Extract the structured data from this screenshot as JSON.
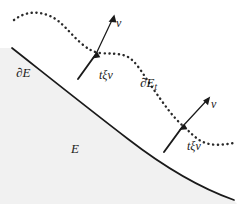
{
  "figure": {
    "background_color": "#ffffff",
    "region_fill_color": "#f1f1f1",
    "curve_color": "#1a1a1a",
    "labels": {
      "set_interior": "E",
      "boundary_original": "∂E",
      "boundary_deformed_prefix": "∂E",
      "boundary_deformed_subscript": "t",
      "normal_1": "ν",
      "normal_2": "ν",
      "displacement_1": "tξν",
      "displacement_2": "tξν"
    },
    "elements": {
      "solid_curve_name": "original boundary curve",
      "dotted_curve_name": "deformed boundary curve",
      "arrow_1_name": "outward normal arrow upper",
      "arrow_2_name": "outward normal arrow lower"
    }
  }
}
